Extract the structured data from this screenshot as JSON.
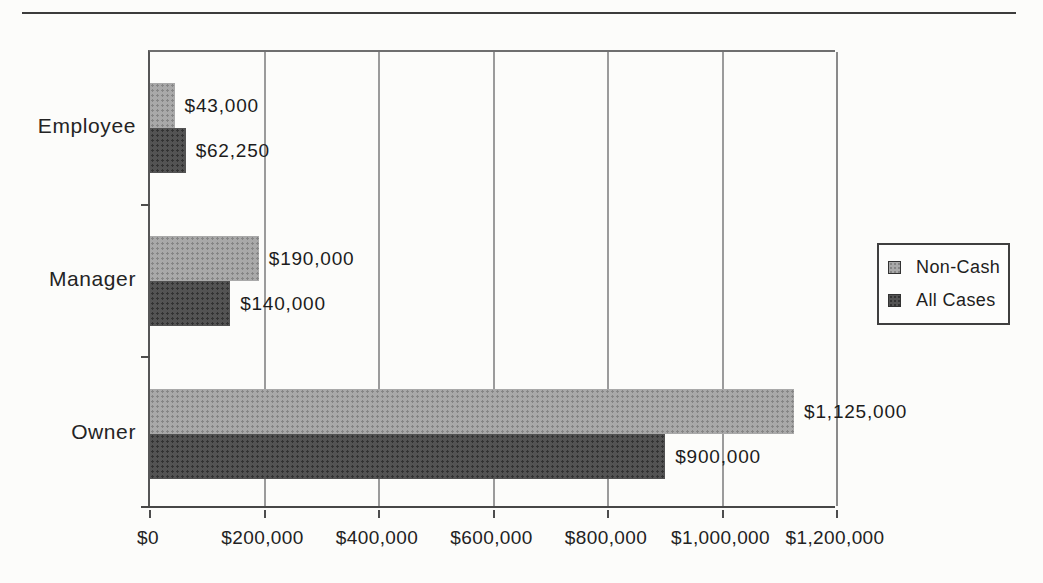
{
  "chart_data": {
    "type": "bar",
    "orientation": "horizontal",
    "title": "",
    "xlabel": "",
    "ylabel": "",
    "categories": [
      "Employee",
      "Manager",
      "Owner"
    ],
    "series": [
      {
        "name": "Non-Cash",
        "color": "#a9a9a9",
        "values": [
          43000,
          190000,
          1125000
        ],
        "data_labels": [
          "$43,000",
          "$190,000",
          "$1,125,000"
        ]
      },
      {
        "name": "All Cases",
        "color": "#535353",
        "values": [
          62250,
          140000,
          900000
        ],
        "data_labels": [
          "$62,250",
          "$140,000",
          "$900,000"
        ]
      }
    ],
    "xlim": [
      0,
      1200000
    ],
    "x_tick_values": [
      0,
      200000,
      400000,
      600000,
      800000,
      1000000,
      1200000
    ],
    "x_tick_labels": [
      "$0",
      "$200,000",
      "$400,000",
      "$600,000",
      "$800,000",
      "$1,000,000",
      "$1,200,000"
    ],
    "grid": true,
    "legend": {
      "position": "right",
      "entries": [
        "Non-Cash",
        "All Cases"
      ]
    }
  },
  "colors": {
    "axis": "#4d4d4d",
    "gridline": "#9b9b9b",
    "text": "#1e1e1e",
    "page_background": "#fcfcfa"
  }
}
